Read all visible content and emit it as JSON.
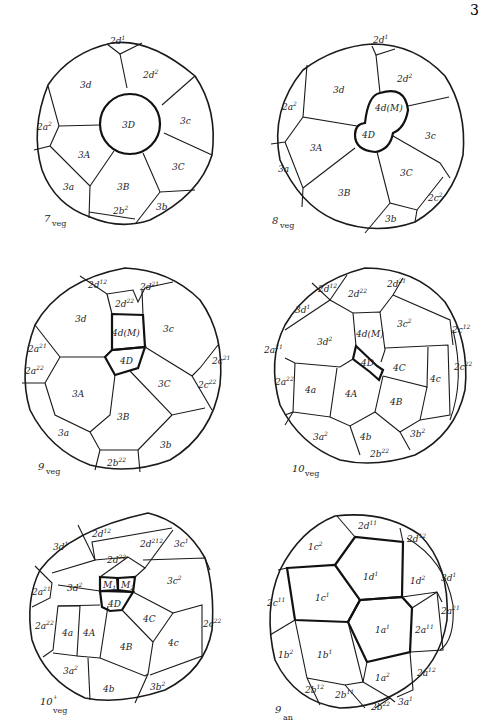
{
  "figure": {
    "page_mark": "3",
    "panels": [
      {
        "id": "7veg",
        "caption_num": "7",
        "caption_sub": "veg",
        "cells": [
          "2d¹",
          "2d²",
          "3d",
          "3D",
          "3c",
          "2a²",
          "3A",
          "3C",
          "3a",
          "3B",
          "3b",
          "2b²"
        ]
      },
      {
        "id": "8veg",
        "caption_num": "8",
        "caption_sub": "veg",
        "cells": [
          "2d¹",
          "2d²",
          "3d",
          "4d(M)",
          "2a²",
          "4D",
          "3c",
          "3A",
          "3C",
          "3a",
          "3B",
          "2c²",
          "3b"
        ]
      },
      {
        "id": "9veg",
        "caption_num": "9",
        "caption_sub": "veg",
        "cells": [
          "2d¹²",
          "2d²¹",
          "2d²²",
          "3d",
          "4d(M)",
          "3c",
          "2a²¹",
          "4D",
          "2a²²",
          "2c²¹",
          "2c²²",
          "3A",
          "3C",
          "3B",
          "3a",
          "3b",
          "2b²²"
        ]
      },
      {
        "id": "10veg",
        "caption_num": "10",
        "caption_sub": "veg",
        "cells": [
          "2d¹²",
          "2d²²",
          "2d²¹",
          "3d¹",
          "3c²",
          "2c¹²",
          "4d(M)",
          "3d²",
          "2a²¹",
          "4D",
          "4C",
          "2c²²",
          "2a²²",
          "4c",
          "4a",
          "4A",
          "4B",
          "3a²",
          "4b",
          "3b²",
          "2b²²"
        ]
      },
      {
        "id": "10+veg",
        "caption_num": "10⁺",
        "caption_sub": "veg",
        "cells": [
          "2d¹²",
          "2d²¹²",
          "3c¹",
          "3d¹",
          "2d²²",
          "M₁",
          "M₂",
          "3c²",
          "2a²¹",
          "3d²",
          "4D",
          "4C",
          "2a²²",
          "4a",
          "4A",
          "2c²²",
          "4B",
          "4c",
          "3a²",
          "4b",
          "3b²"
        ]
      },
      {
        "id": "9an",
        "caption_num": "9",
        "caption_sub": "an",
        "cells": [
          "2d¹¹",
          "2d¹²",
          "1c²",
          "1d¹",
          "1d²",
          "3d¹",
          "1c¹",
          "2c¹¹",
          "2a²¹",
          "1a¹",
          "2a¹¹",
          "1b²",
          "1b¹",
          "2a¹²",
          "1a²",
          "2b¹²",
          "2b¹¹",
          "2b²²",
          "3a¹"
        ]
      }
    ]
  }
}
